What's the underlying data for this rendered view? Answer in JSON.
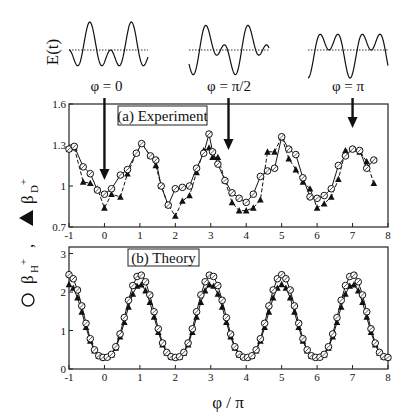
{
  "chart_data": [
    {
      "type": "line",
      "panel": "waveforms",
      "ylabel": "E(t)",
      "description": "Two-color field E(t) = cos(wt) + cos(2wt + phi) for three relative phases",
      "waveforms": [
        {
          "label": "φ = 0",
          "phi": 0
        },
        {
          "label": "φ = π/2",
          "phi": 1.5708
        },
        {
          "label": "φ = π",
          "phi": 3.1416
        }
      ],
      "baseline": "dotted"
    },
    {
      "type": "line",
      "panel": "a",
      "title": "(a) Experiment",
      "xlabel": "φ / π",
      "ylabel": "○ β_H+ , ▲ β_D+",
      "xlim": [
        -1,
        8
      ],
      "ylim": [
        0.7,
        1.6
      ],
      "xticks": [
        -1,
        0,
        1,
        2,
        3,
        4,
        5,
        6,
        7,
        8
      ],
      "yticks": [
        0.7,
        1,
        1.3,
        1.6
      ],
      "arrows_at_x": [
        0,
        3.5,
        7
      ],
      "series": [
        {
          "name": "β_H+ (open circles, solid line)",
          "x": [
            -1,
            -0.85,
            -0.6,
            -0.4,
            -0.2,
            0,
            0.2,
            0.45,
            0.65,
            0.9,
            1.05,
            1.3,
            1.45,
            1.6,
            1.8,
            2.0,
            2.2,
            2.4,
            2.6,
            2.8,
            2.95,
            3.05,
            3.2,
            3.4,
            3.6,
            3.8,
            4.0,
            4.2,
            4.4,
            4.6,
            4.8,
            5.0,
            5.2,
            5.4,
            5.6,
            5.8,
            6.0,
            6.2,
            6.4,
            6.6,
            6.8,
            7.0,
            7.2,
            7.4,
            7.6
          ],
          "y": [
            1.27,
            1.29,
            1.14,
            1.09,
            0.97,
            0.94,
            0.98,
            1.08,
            1.12,
            1.24,
            1.31,
            1.22,
            1.19,
            1.0,
            0.86,
            0.98,
            0.99,
            1.0,
            1.13,
            1.24,
            1.38,
            1.25,
            1.16,
            1.04,
            0.95,
            0.91,
            0.88,
            0.94,
            1.07,
            1.11,
            1.13,
            1.36,
            1.27,
            1.23,
            1.06,
            0.92,
            0.91,
            0.93,
            0.98,
            1.15,
            1.22,
            1.27,
            1.26,
            1.13,
            1.19
          ],
          "marker": "open-circle",
          "line": "solid"
        },
        {
          "name": "β_D+ (filled triangles, dashed line)",
          "x": [
            -1,
            -0.85,
            -0.6,
            -0.4,
            -0.2,
            0,
            0.2,
            0.45,
            0.65,
            0.9,
            1.05,
            1.3,
            1.45,
            1.6,
            1.8,
            2.0,
            2.2,
            2.4,
            2.6,
            2.8,
            2.95,
            3.05,
            3.2,
            3.4,
            3.6,
            3.8,
            4.0,
            4.2,
            4.4,
            4.6,
            4.8,
            5.0,
            5.2,
            5.4,
            5.6,
            5.8,
            6.0,
            6.2,
            6.4,
            6.6,
            6.8,
            7.0,
            7.2,
            7.4,
            7.6
          ],
          "y": [
            1.27,
            1.28,
            1.03,
            1.02,
            0.98,
            0.84,
            0.94,
            0.92,
            1.09,
            1.24,
            1.31,
            1.22,
            1.15,
            1.0,
            0.86,
            0.78,
            0.89,
            0.93,
            1.1,
            1.26,
            1.28,
            1.21,
            1.21,
            1.04,
            0.88,
            0.82,
            0.82,
            0.84,
            0.9,
            1.25,
            1.25,
            1.36,
            1.2,
            1.12,
            1.03,
            0.98,
            0.84,
            0.87,
            0.92,
            1.05,
            1.26,
            1.27,
            1.25,
            1.18,
            1.02
          ],
          "marker": "filled-triangle",
          "line": "dashed"
        }
      ]
    },
    {
      "type": "line",
      "panel": "b",
      "title": "(b) Theory",
      "xlabel": "φ / π",
      "ylabel": "○ β_H+ , ▲ β_D+",
      "xlim": [
        -1,
        8
      ],
      "ylim": [
        0,
        3.1
      ],
      "xticks": [
        -1,
        0,
        1,
        2,
        3,
        4,
        5,
        6,
        7,
        8
      ],
      "yticks": [
        0,
        1,
        2,
        3
      ],
      "series": [
        {
          "name": "β_H+ (open circles)",
          "model": "periodic, peaks ~2.45 at odd φ/π, minima ~0.3 at even φ/π",
          "peak": 2.45,
          "trough": 0.3,
          "marker": "open-circle"
        },
        {
          "name": "β_D+ (filled triangles)",
          "model": "periodic, peaks ~2.2 at odd φ/π, minima ~0.3 at even φ/π",
          "peak": 2.2,
          "trough": 0.3,
          "marker": "filled-triangle"
        }
      ]
    }
  ],
  "labels": {
    "et_label": "E(t)",
    "phase_labels": [
      "φ = 0",
      "φ = π/2",
      "φ = π"
    ],
    "panel_a": "(a) Experiment",
    "panel_b": "(b) Theory",
    "xlabel": "φ / π",
    "ylabel_h": "β",
    "ylabel_h_sub": "H",
    "ylabel_d": "β",
    "ylabel_d_sub": "D",
    "xticks": [
      "-1",
      "0",
      "1",
      "2",
      "3",
      "4",
      "5",
      "6",
      "7",
      "8"
    ],
    "yticks_a": [
      "0.7",
      "1",
      "1.3",
      "1.6"
    ],
    "yticks_b": [
      "0",
      "1",
      "2",
      "3"
    ]
  }
}
